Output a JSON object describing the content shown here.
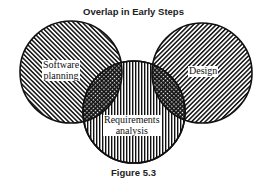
{
  "diagram": {
    "title": "Overlap in Early Steps",
    "caption": "Figure 5.3",
    "type": "venn",
    "sets": [
      {
        "id": "software-planning",
        "label_line1": "Software",
        "label_line2": "planning",
        "pattern": "diagonal-hatch-forward"
      },
      {
        "id": "design",
        "label_line1": "Design",
        "pattern": "diagonal-hatch-backward"
      },
      {
        "id": "requirements-analysis",
        "label_line1": "Requirements",
        "label_line2": "analysis",
        "pattern": "vertical-hatch"
      }
    ],
    "overlaps": [
      {
        "between": [
          "software-planning",
          "requirements-analysis"
        ],
        "pattern": "crosshatch"
      },
      {
        "between": [
          "design",
          "requirements-analysis"
        ],
        "pattern": "crosshatch"
      }
    ],
    "colors": {
      "ink": "#111111",
      "background": "#ffffff"
    }
  }
}
